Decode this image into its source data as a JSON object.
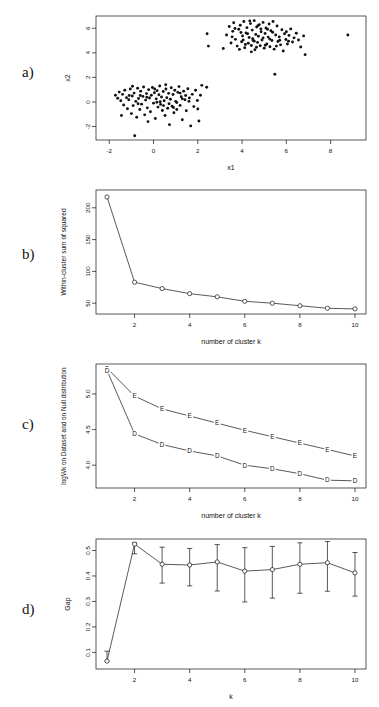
{
  "figure": {
    "background": "#ffffff",
    "ink": "#111111"
  },
  "panels": [
    {
      "letter": "a)",
      "chart_key": "panel_a"
    },
    {
      "letter": "b)",
      "chart_key": "panel_b"
    },
    {
      "letter": "c)",
      "chart_key": "panel_c"
    },
    {
      "letter": "d)",
      "chart_key": "panel_d"
    }
  ],
  "chart_data": [
    {
      "id": "panel_a",
      "type": "scatter",
      "title": "",
      "xlabel": "x1",
      "ylabel": "x2",
      "xlim": [
        -2.6,
        9.6
      ],
      "ylim": [
        -3.1,
        7.0
      ],
      "xticks": [
        -2,
        0,
        2,
        4,
        6,
        8
      ],
      "yticks": [
        -2,
        0,
        2,
        4,
        6
      ],
      "grid": false,
      "legend": "none",
      "marker": "filled-circle",
      "series": [
        {
          "name": "cluster 1",
          "center": [
            0.35,
            -0.1
          ],
          "points": [
            [
              -1.72,
              0.55
            ],
            [
              -1.62,
              0.3
            ],
            [
              -1.55,
              0.8
            ],
            [
              -1.48,
              0.1
            ],
            [
              -1.4,
              0.62
            ],
            [
              -1.35,
              -0.25
            ],
            [
              -1.3,
              0.95
            ],
            [
              -1.22,
              0.35
            ],
            [
              -1.18,
              -0.55
            ],
            [
              -1.12,
              0.18
            ],
            [
              -1.05,
              1.05
            ],
            [
              -1.0,
              -0.95
            ],
            [
              -0.96,
              0.48
            ],
            [
              -0.92,
              -0.3
            ],
            [
              -0.88,
              0.72
            ],
            [
              -0.85,
              -2.75
            ],
            [
              -0.8,
              0.05
            ],
            [
              -0.76,
              -1.25
            ],
            [
              -0.72,
              1.12
            ],
            [
              -0.68,
              0.28
            ],
            [
              -0.62,
              -0.62
            ],
            [
              -0.58,
              0.88
            ],
            [
              -0.54,
              -0.18
            ],
            [
              -0.48,
              0.45
            ],
            [
              -0.45,
              1.22
            ],
            [
              -0.4,
              -1.05
            ],
            [
              -0.36,
              0.15
            ],
            [
              -0.32,
              0.68
            ],
            [
              -0.28,
              -0.48
            ],
            [
              -0.22,
              1.0
            ],
            [
              -0.18,
              0.32
            ],
            [
              -0.14,
              -0.8
            ],
            [
              -0.1,
              0.55
            ],
            [
              -0.05,
              1.18
            ],
            [
              0.0,
              -0.1
            ],
            [
              0.04,
              0.75
            ],
            [
              0.08,
              -1.35
            ],
            [
              0.12,
              0.25
            ],
            [
              0.16,
              0.92
            ],
            [
              0.2,
              -0.42
            ],
            [
              0.24,
              0.58
            ],
            [
              0.28,
              1.3
            ],
            [
              0.32,
              -0.2
            ],
            [
              0.36,
              0.4
            ],
            [
              0.4,
              -0.7
            ],
            [
              0.44,
              0.85
            ],
            [
              0.48,
              0.1
            ],
            [
              0.52,
              -1.1
            ],
            [
              0.56,
              1.05
            ],
            [
              0.6,
              0.35
            ],
            [
              0.64,
              -0.52
            ],
            [
              0.68,
              0.7
            ],
            [
              0.72,
              -1.85
            ],
            [
              0.76,
              0.22
            ],
            [
              0.8,
              1.15
            ],
            [
              0.84,
              -0.35
            ],
            [
              0.88,
              0.6
            ],
            [
              0.92,
              -0.88
            ],
            [
              0.96,
              0.95
            ],
            [
              1.0,
              0.05
            ],
            [
              1.05,
              -0.62
            ],
            [
              1.1,
              0.78
            ],
            [
              1.15,
              1.25
            ],
            [
              1.2,
              -0.28
            ],
            [
              1.25,
              0.42
            ],
            [
              1.3,
              -1.45
            ],
            [
              1.36,
              0.88
            ],
            [
              1.42,
              0.18
            ],
            [
              1.48,
              -0.72
            ],
            [
              1.55,
              1.08
            ],
            [
              1.62,
              0.32
            ],
            [
              1.68,
              -1.95
            ],
            [
              1.75,
              0.62
            ],
            [
              1.82,
              -0.38
            ],
            [
              1.9,
              0.95
            ],
            [
              1.98,
              0.12
            ],
            [
              2.05,
              -1.55
            ],
            [
              2.12,
              0.55
            ],
            [
              2.18,
              1.35
            ],
            [
              -1.45,
              -1.1
            ],
            [
              -0.95,
              1.28
            ],
            [
              -0.25,
              -1.6
            ],
            [
              0.15,
              -0.02
            ],
            [
              0.55,
              1.4
            ],
            [
              1.05,
              -0.05
            ],
            [
              1.45,
              0.52
            ],
            [
              0.7,
              -0.15
            ],
            [
              0.3,
              0.02
            ],
            [
              -0.6,
              0.52
            ],
            [
              2.4,
              1.2
            ],
            [
              -1.1,
              0.52
            ],
            [
              0.45,
              -0.3
            ],
            [
              1.2,
              0.72
            ],
            [
              -0.3,
              0.38
            ],
            [
              0.9,
              -0.45
            ],
            [
              1.6,
              0.05
            ],
            [
              -0.7,
              -0.15
            ],
            [
              0.05,
              1.05
            ],
            [
              2.0,
              -0.58
            ],
            [
              1.3,
              0.25
            ]
          ]
        },
        {
          "name": "cluster 2",
          "center": [
            4.7,
            5.0
          ],
          "points": [
            [
              3.15,
              4.35
            ],
            [
              3.3,
              5.45
            ],
            [
              3.42,
              6.15
            ],
            [
              3.5,
              4.8
            ],
            [
              3.58,
              5.75
            ],
            [
              3.62,
              6.45
            ],
            [
              3.7,
              5.1
            ],
            [
              3.78,
              4.55
            ],
            [
              3.85,
              5.92
            ],
            [
              3.92,
              6.25
            ],
            [
              3.98,
              4.9
            ],
            [
              4.02,
              5.38
            ],
            [
              4.08,
              6.55
            ],
            [
              4.12,
              4.42
            ],
            [
              4.18,
              5.62
            ],
            [
              4.22,
              6.05
            ],
            [
              4.28,
              4.78
            ],
            [
              4.32,
              5.25
            ],
            [
              4.38,
              6.38
            ],
            [
              4.42,
              4.6
            ],
            [
              4.46,
              5.85
            ],
            [
              4.5,
              5.02
            ],
            [
              4.55,
              6.62
            ],
            [
              4.58,
              4.25
            ],
            [
              4.62,
              5.5
            ],
            [
              4.66,
              6.1
            ],
            [
              4.7,
              4.85
            ],
            [
              4.74,
              5.35
            ],
            [
              4.78,
              6.3
            ],
            [
              4.82,
              4.58
            ],
            [
              4.86,
              5.72
            ],
            [
              4.9,
              5.05
            ],
            [
              4.95,
              6.48
            ],
            [
              5.0,
              4.38
            ],
            [
              5.04,
              5.58
            ],
            [
              5.08,
              6.02
            ],
            [
              5.12,
              4.72
            ],
            [
              5.18,
              5.28
            ],
            [
              5.22,
              6.35
            ],
            [
              5.26,
              4.5
            ],
            [
              5.3,
              5.8
            ],
            [
              5.35,
              5.0
            ],
            [
              5.4,
              6.55
            ],
            [
              5.45,
              4.3
            ],
            [
              5.48,
              2.25
            ],
            [
              5.52,
              5.45
            ],
            [
              5.58,
              6.18
            ],
            [
              5.62,
              4.92
            ],
            [
              5.68,
              5.3
            ],
            [
              5.74,
              4.65
            ],
            [
              5.8,
              5.88
            ],
            [
              5.86,
              4.15
            ],
            [
              5.92,
              5.55
            ],
            [
              5.98,
              5.08
            ],
            [
              6.05,
              4.72
            ],
            [
              6.12,
              5.42
            ],
            [
              6.2,
              5.95
            ],
            [
              6.28,
              4.88
            ],
            [
              6.35,
              5.22
            ],
            [
              6.45,
              5.6
            ],
            [
              6.55,
              5.05
            ],
            [
              6.65,
              4.48
            ],
            [
              6.78,
              5.38
            ],
            [
              6.85,
              3.85
            ],
            [
              8.78,
              5.45
            ],
            [
              2.42,
              5.55
            ],
            [
              2.48,
              4.55
            ],
            [
              4.05,
              5.05
            ],
            [
              4.48,
              5.15
            ],
            [
              4.95,
              5.22
            ],
            [
              3.88,
              4.28
            ],
            [
              4.65,
              4.45
            ],
            [
              5.15,
              5.92
            ],
            [
              5.55,
              4.55
            ],
            [
              4.35,
              6.6
            ],
            [
              4.25,
              5.55
            ],
            [
              4.85,
              5.95
            ],
            [
              5.05,
              4.62
            ],
            [
              3.95,
              5.65
            ],
            [
              4.55,
              4.95
            ],
            [
              5.25,
              5.12
            ],
            [
              4.15,
              4.68
            ],
            [
              5.7,
              5.02
            ],
            [
              6.0,
              5.72
            ],
            [
              3.68,
              5.98
            ],
            [
              4.72,
              6.2
            ],
            [
              5.38,
              5.68
            ],
            [
              4.42,
              4.08
            ],
            [
              3.55,
              5.3
            ],
            [
              6.1,
              4.95
            ]
          ]
        }
      ]
    },
    {
      "id": "panel_b",
      "type": "line",
      "title": "",
      "xlabel": "number of cluster k",
      "ylabel": "Within-cluster sum of squared",
      "xlim": [
        0.6,
        10.4
      ],
      "ylim": [
        33,
        228
      ],
      "xticks": [
        2,
        4,
        6,
        8,
        10
      ],
      "yticks": [
        50,
        100,
        150,
        200
      ],
      "grid": false,
      "legend": "none",
      "marker": "open-circle",
      "x": [
        1,
        2,
        3,
        4,
        5,
        6,
        7,
        8,
        9,
        10
      ],
      "values": [
        217,
        83,
        73,
        65,
        60,
        53,
        50,
        46,
        42,
        41
      ]
    },
    {
      "id": "panel_c",
      "type": "line",
      "title": "",
      "xlabel": "number of cluster k",
      "ylabel": "logWk on Dataset and on Null distribution",
      "xlim": [
        0.6,
        10.4
      ],
      "ylim": [
        3.68,
        5.42
      ],
      "xticks": [
        2,
        4,
        6,
        8,
        10
      ],
      "yticks": [
        4.0,
        4.5,
        5.0
      ],
      "grid": false,
      "legend": "in-plot-letters",
      "series": [
        {
          "name": "E",
          "marker": "E",
          "x": [
            1,
            2,
            3,
            4,
            5,
            6,
            7,
            8,
            9,
            10
          ],
          "values": [
            5.36,
            4.97,
            4.79,
            4.69,
            4.59,
            4.49,
            4.4,
            4.31,
            4.22,
            4.13
          ]
        },
        {
          "name": "D",
          "marker": "D",
          "x": [
            1,
            2,
            3,
            4,
            5,
            6,
            7,
            8,
            9,
            10
          ],
          "values": [
            5.33,
            4.44,
            4.29,
            4.2,
            4.13,
            4.0,
            3.95,
            3.88,
            3.79,
            3.78
          ]
        }
      ]
    },
    {
      "id": "panel_d",
      "type": "line",
      "title": "",
      "xlabel": "k",
      "ylabel": "Gap",
      "xlim": [
        0.6,
        10.4
      ],
      "ylim": [
        0.035,
        0.545
      ],
      "xticks": [
        2,
        4,
        6,
        8,
        10
      ],
      "yticks": [
        0.1,
        0.2,
        0.3,
        0.4,
        0.5
      ],
      "grid": false,
      "legend": "none",
      "marker": "open-circle",
      "errorbars": true,
      "x": [
        1,
        2,
        3,
        4,
        5,
        6,
        7,
        8,
        9,
        10
      ],
      "values": [
        0.066,
        0.525,
        0.446,
        0.443,
        0.455,
        0.419,
        0.425,
        0.446,
        0.452,
        0.412
      ],
      "err_low": [
        0.066,
        0.487,
        0.372,
        0.361,
        0.341,
        0.298,
        0.313,
        0.332,
        0.34,
        0.321
      ],
      "err_high": [
        0.105,
        0.53,
        0.513,
        0.508,
        0.523,
        0.511,
        0.516,
        0.53,
        0.535,
        0.492
      ]
    }
  ]
}
